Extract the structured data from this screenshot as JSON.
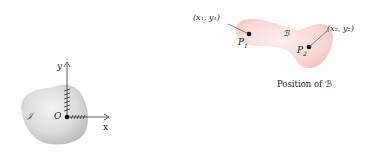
{
  "left_figure": {
    "body_label": "𝒥",
    "origin_label": "O",
    "x_axis_label": "x",
    "y_axis_label": "y",
    "fill_color": "#d9d9d9"
  },
  "right_figure": {
    "body_label": "ℬ",
    "point1_label": "P",
    "point1_sub": "1",
    "point2_label": "P",
    "point2_sub": "2",
    "coord1_label": "(x₁, y₁)",
    "coord2_label": "(x₂, y₂)",
    "caption": "Position of ℬ",
    "fill_color": "#f6d6d2"
  }
}
